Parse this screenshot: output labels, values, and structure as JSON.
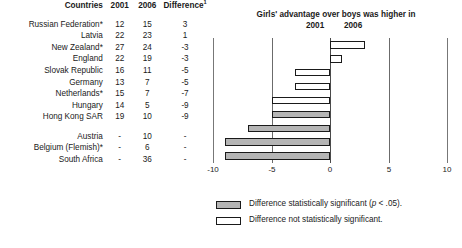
{
  "table": {
    "headers": {
      "country": "Countries",
      "year1": "2001",
      "year2": "2006",
      "difference": "Difference",
      "difference_superscript": "1"
    },
    "rows": [
      {
        "country": "Russian Federation*",
        "y2001": "12",
        "y2006": "15",
        "difference": "3"
      },
      {
        "country": "Latvia",
        "y2001": "22",
        "y2006": "23",
        "difference": "1"
      },
      {
        "country": "New Zealand*",
        "y2001": "27",
        "y2006": "24",
        "difference": "-3"
      },
      {
        "country": "England",
        "y2001": "22",
        "y2006": "19",
        "difference": "-3"
      },
      {
        "country": "Slovak Republic",
        "y2001": "16",
        "y2006": "11",
        "difference": "-5"
      },
      {
        "country": "Germany",
        "y2001": "13",
        "y2006": "7",
        "difference": "-5"
      },
      {
        "country": "Netherlands*",
        "y2001": "15",
        "y2006": "7",
        "difference": "-7"
      },
      {
        "country": "Hungary",
        "y2001": "14",
        "y2006": "5",
        "difference": "-9"
      },
      {
        "country": "Hong Kong SAR",
        "y2001": "19",
        "y2006": "10",
        "difference": "-9"
      }
    ],
    "rows_no_trend": [
      {
        "country": "Austria",
        "y2001": "-",
        "y2006": "10",
        "difference": "-"
      },
      {
        "country": "Belgium (Flemish)*",
        "y2001": "-",
        "y2006": "6",
        "difference": "-"
      },
      {
        "country": "South Africa",
        "y2001": "-",
        "y2006": "36",
        "difference": "-"
      }
    ]
  },
  "chart_header": {
    "title": "Girls' advantage over boys was higher in",
    "left_year": "2001",
    "right_year": "2006"
  },
  "legend": {
    "significant": "Difference statistically significant (p < .05).",
    "not_significant": "Difference not statistically significant."
  },
  "colors": {
    "significant_fill": "#b5b5b5",
    "not_significant_fill": "#ffffff",
    "bar_outline": "#1a1a1a",
    "gridline": "#6b6b6b"
  },
  "chart_data": {
    "type": "bar",
    "orientation": "horizontal",
    "title": "Girls' advantage over boys was higher in",
    "xlabel": "",
    "ylabel": "",
    "xlim": [
      -10,
      10
    ],
    "xticks": [
      -10,
      -5,
      0,
      5,
      10
    ],
    "xtick_labels": [
      "-10",
      "-5",
      "0",
      "5",
      "10"
    ],
    "grid": true,
    "legend_position": "bottom",
    "categories": [
      "Russian Federation*",
      "Latvia",
      "New Zealand*",
      "England",
      "Slovak Republic",
      "Germany",
      "Netherlands*",
      "Hungary",
      "Hong Kong SAR"
    ],
    "values": [
      3,
      1,
      -3,
      -3,
      -5,
      -5,
      -7,
      -9,
      -9
    ],
    "significance": [
      "not_significant",
      "not_significant",
      "not_significant",
      "not_significant",
      "not_significant",
      "significant",
      "significant",
      "significant",
      "significant"
    ],
    "series": [
      {
        "name": "Difference (2006 minus 2001)",
        "values": [
          3,
          1,
          -3,
          -3,
          -5,
          -5,
          -7,
          -9,
          -9
        ]
      }
    ],
    "annotations": {
      "left_side_label": "2001",
      "right_side_label": "2006"
    }
  }
}
